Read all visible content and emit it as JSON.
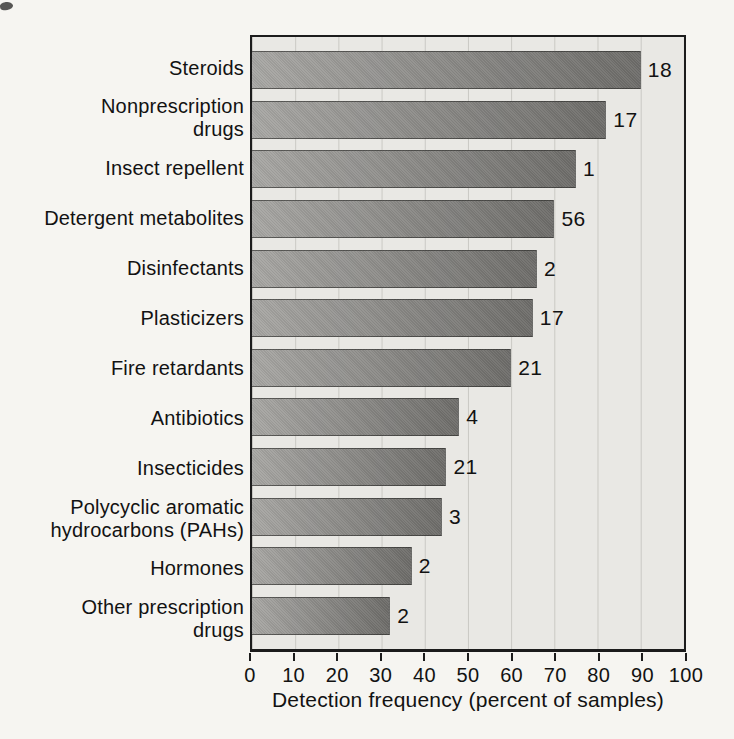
{
  "figure": {
    "axis_title": "Detection frequency (percent of samples)"
  },
  "colors": {
    "page_bg": "#f6f5f1",
    "plot_bg": "#e9e8e4",
    "gridline": "#c9c8c3",
    "bar_gradient_left": "#a8a7a4",
    "bar_gradient_right": "#6f6e6b",
    "plot_border": "#1c1c1c",
    "text": "#121212"
  },
  "chart_data": {
    "type": "bar",
    "orientation": "horizontal",
    "title": "",
    "xlabel": "Detection frequency (percent of samples)",
    "ylabel": "",
    "xlim": [
      0,
      100
    ],
    "xticks": [
      0,
      10,
      20,
      30,
      40,
      50,
      60,
      70,
      80,
      90,
      100
    ],
    "grid": "vertical",
    "legend": "none",
    "categories": [
      "Steroids",
      "Nonprescription\ndrugs",
      "Insect repellent",
      "Detergent metabolites",
      "Disinfectants",
      "Plasticizers",
      "Fire retardants",
      "Antibiotics",
      "Insecticides",
      "Polycyclic aromatic\nhydrocarbons (PAHs)",
      "Hormones",
      "Other prescription\ndrugs"
    ],
    "values": [
      90,
      82,
      75,
      70,
      66,
      65,
      60,
      48,
      45,
      44,
      37,
      32
    ],
    "bar_end_labels": [
      "18",
      "17",
      "1",
      "56",
      "2",
      "17",
      "21",
      "4",
      "21",
      "3",
      "2",
      "2"
    ]
  }
}
